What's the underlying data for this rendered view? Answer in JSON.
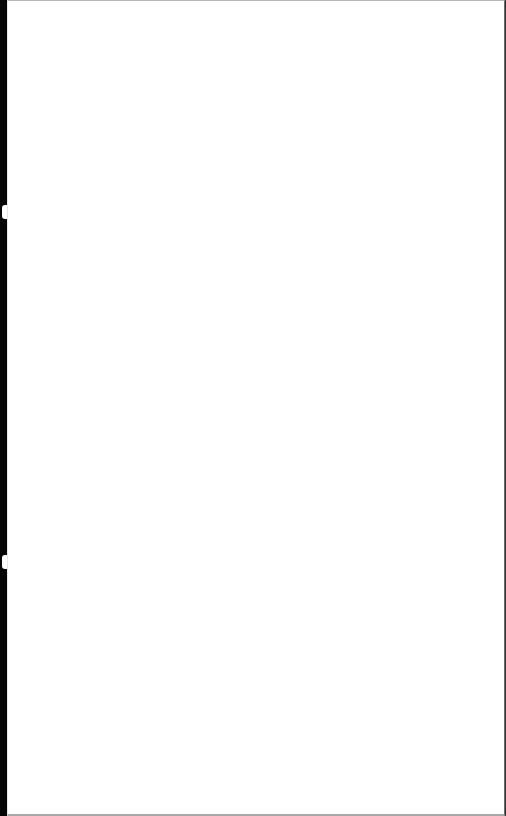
{
  "page": {
    "background_color": "#ffffff",
    "edge_color": "#050505",
    "border_color": "#a8a8a8",
    "content": ""
  }
}
